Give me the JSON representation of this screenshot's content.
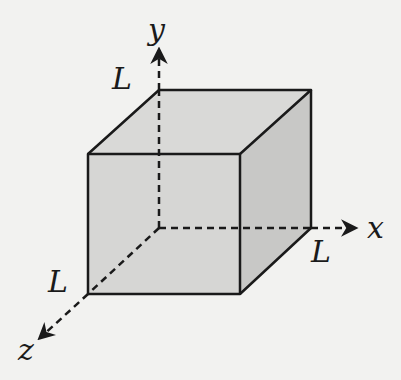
{
  "diagram": {
    "type": "cube-with-axes",
    "colors": {
      "background": "#f2f2f0",
      "stroke": "#1a1a1a",
      "front_face": "#d6d6d4",
      "top_face": "#d9d9d7",
      "right_face": "#c8c8c6"
    },
    "axes": {
      "x": {
        "label": "x"
      },
      "y": {
        "label": "y"
      },
      "z": {
        "label": "z"
      }
    },
    "edge_labels": {
      "y_edge": "L",
      "x_edge": "L",
      "z_edge": "L"
    }
  }
}
